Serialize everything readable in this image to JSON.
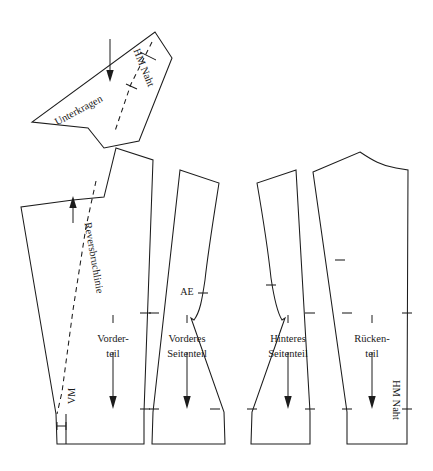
{
  "document": {
    "title": "Schnittmuster Sakko",
    "background_color": "#ffffff",
    "line_color": "#1c1c1c",
    "width": 433,
    "height": 471
  },
  "pieces": [
    {
      "id": "unterkragen",
      "name": "Unterkragen",
      "label": "Unterkragen",
      "seam_label": "HM Naht",
      "has_fold_line": true,
      "grainline": "down"
    },
    {
      "id": "vorderteil",
      "name": "Vorderteil",
      "label_line1": "Vorder-",
      "label_line2": "teil",
      "fold_label": "Reversbruchlinie",
      "center_front_label": "VM",
      "grainline": "down"
    },
    {
      "id": "vorderes-seitenteil",
      "name": "Vorderes Seitenteil",
      "label_line1": "Vorderes",
      "label_line2": "Seitenteil",
      "notch_label": "AE",
      "grainline": "down"
    },
    {
      "id": "hinteres-seitenteil",
      "name": "Hinteres Seitenteil",
      "label_line1": "Hinteres",
      "label_line2": "Seitenteil",
      "grainline": "down"
    },
    {
      "id": "rueckenteil",
      "name": "Rückenteil",
      "label_line1": "Rücken-",
      "label_line2": "teil",
      "seam_label": "HM Naht",
      "grainline": "down"
    }
  ],
  "annotations": {
    "hm_naht_collar": "HM Naht",
    "unterkragen": "Unterkragen",
    "reversbruchlinie": "Reversbruchlinie",
    "vm": "VM",
    "ae": "AE",
    "vorderteil_1": "Vorder-",
    "vorderteil_2": "teil",
    "vorderes_seitenteil_1": "Vorderes",
    "vorderes_seitenteil_2": "Seitenteil",
    "hinteres_seitenteil_1": "Hinteres",
    "hinteres_seitenteil_2": "Seitenteil",
    "rueckenteil_1": "Rücken-",
    "rueckenteil_2": "teil",
    "hm_naht_back": "HM Naht"
  }
}
